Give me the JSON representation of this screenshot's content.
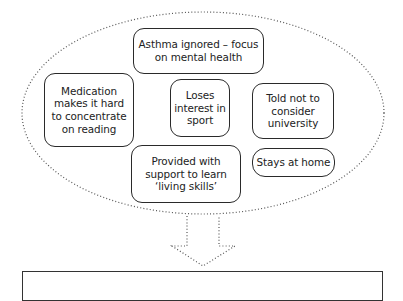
{
  "diagram": {
    "type": "influence-diagram",
    "group_shape": "dotted-ellipse",
    "nodes": [
      {
        "id": "asthma",
        "label": "Asthma ignored – focus on mental health"
      },
      {
        "id": "medication",
        "label": "Medication makes it hard to concentrate on reading"
      },
      {
        "id": "loses",
        "label": "Loses interest in sport"
      },
      {
        "id": "told",
        "label": "Told not to consider university"
      },
      {
        "id": "provided",
        "label": "Provided with support to learn ‘living skills’"
      },
      {
        "id": "stays",
        "label": "Stays at home"
      }
    ],
    "arrow": {
      "style": "dotted",
      "direction": "down",
      "from": "group",
      "to": "outcome"
    },
    "outcome": {
      "label": ""
    }
  }
}
